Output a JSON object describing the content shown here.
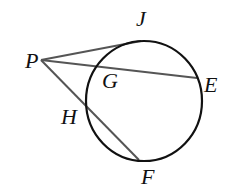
{
  "diagram": {
    "type": "circle with secants and tangent from external point",
    "circle": {
      "cx": 144,
      "cy": 101,
      "rx": 58,
      "ry": 60
    },
    "points": {
      "P": {
        "label": "P",
        "x": 41,
        "y": 60
      },
      "J": {
        "label": "J",
        "x": 141,
        "y": 41
      },
      "G": {
        "label": "G",
        "x": 96,
        "y": 66
      },
      "E": {
        "label": "E",
        "x": 197,
        "y": 78
      },
      "H": {
        "label": "H",
        "x": 87,
        "y": 105
      },
      "F": {
        "label": "F",
        "x": 139,
        "y": 160
      }
    },
    "segments": [
      {
        "name": "PJ",
        "from": "P",
        "to": "J"
      },
      {
        "name": "PE",
        "from": "P",
        "to": "E"
      },
      {
        "name": "PF",
        "from": "P",
        "to": "F"
      }
    ],
    "colors": {
      "circle": "#111111",
      "lines": "#555555"
    }
  }
}
